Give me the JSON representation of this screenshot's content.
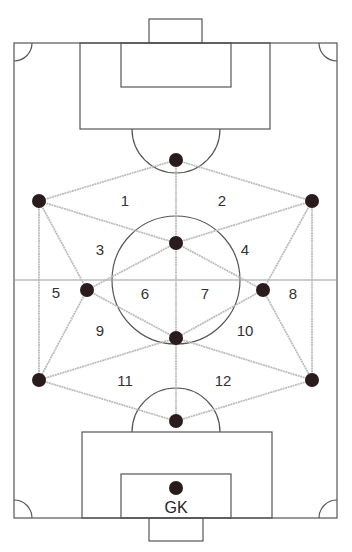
{
  "diagram": {
    "type": "soccer-field-formation",
    "colors": {
      "field_lines": "#555555",
      "halfway_line": "#999999",
      "connectors": "#bdbdbd",
      "players": "#2a1c1c",
      "labels": "#333333"
    },
    "players": [
      {
        "id": "top",
        "x": 176,
        "y": 160
      },
      {
        "id": "left-upper",
        "x": 39,
        "y": 201
      },
      {
        "id": "right-upper",
        "x": 312,
        "y": 201
      },
      {
        "id": "center-upper",
        "x": 176,
        "y": 243
      },
      {
        "id": "left-mid",
        "x": 87,
        "y": 290
      },
      {
        "id": "right-mid",
        "x": 263,
        "y": 290
      },
      {
        "id": "center-lower",
        "x": 176,
        "y": 338
      },
      {
        "id": "left-lower",
        "x": 39,
        "y": 380
      },
      {
        "id": "right-lower",
        "x": 312,
        "y": 380
      },
      {
        "id": "bottom",
        "x": 176,
        "y": 421
      },
      {
        "id": "goalkeeper",
        "x": 176,
        "y": 488
      }
    ],
    "zones": [
      {
        "label": "1",
        "x": 125,
        "y": 200
      },
      {
        "label": "2",
        "x": 222,
        "y": 200
      },
      {
        "label": "3",
        "x": 100,
        "y": 249
      },
      {
        "label": "4",
        "x": 245,
        "y": 249
      },
      {
        "label": "5",
        "x": 56,
        "y": 292
      },
      {
        "label": "6",
        "x": 145,
        "y": 293
      },
      {
        "label": "7",
        "x": 205,
        "y": 293
      },
      {
        "label": "8",
        "x": 293,
        "y": 293
      },
      {
        "label": "9",
        "x": 100,
        "y": 330
      },
      {
        "label": "10",
        "x": 245,
        "y": 330
      },
      {
        "label": "11",
        "x": 125,
        "y": 380
      },
      {
        "label": "12",
        "x": 223,
        "y": 380
      }
    ],
    "gk_label": "GK"
  }
}
